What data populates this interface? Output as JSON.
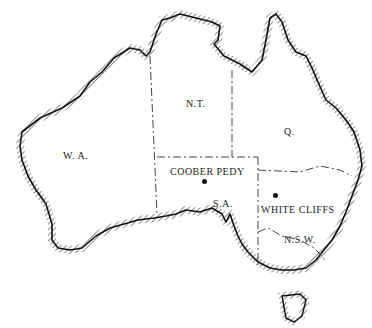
{
  "map": {
    "title": "Map of Australia",
    "colors": {
      "coast": "#111111",
      "border": "#444444",
      "background": "#ffffff"
    },
    "regions": [
      {
        "id": "wa",
        "label": "W. A.",
        "x": 63,
        "y": 150
      },
      {
        "id": "nt",
        "label": "N.T.",
        "x": 186,
        "y": 98
      },
      {
        "id": "q",
        "label": "Q.",
        "x": 284,
        "y": 126
      },
      {
        "id": "sa",
        "label": "S.A.",
        "x": 213,
        "y": 198
      },
      {
        "id": "nsw",
        "label": "N.S.W.",
        "x": 284,
        "y": 234
      }
    ],
    "places": [
      {
        "id": "coober-pedy",
        "label": "COOBER PEDY",
        "label_x": 170,
        "label_y": 166,
        "dot_x": 204,
        "dot_y": 180
      },
      {
        "id": "white-cliffs",
        "label": "WHITE CLIFFS",
        "label_x": 261,
        "label_y": 204,
        "dot_x": 275,
        "dot_y": 194
      }
    ]
  }
}
